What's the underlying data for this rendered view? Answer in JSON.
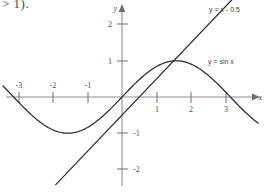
{
  "page": {
    "background_color": "#ffffff",
    "fragment_text": "> 1)."
  },
  "chart_data": {
    "type": "line",
    "title": "",
    "subtitle": "",
    "xlabel": "x",
    "ylabel": "y",
    "xlim": [
      -3.6,
      4.0
    ],
    "ylim": [
      -2.6,
      2.5
    ],
    "grid": false,
    "legend_position": "inline-annotation",
    "x_ticks": [
      -3,
      -2,
      -1,
      1,
      2,
      3
    ],
    "x_tick_labels": [
      "-3",
      "-2",
      "-1",
      "1",
      "2",
      "3"
    ],
    "y_ticks": [
      2,
      1,
      -1,
      -2
    ],
    "y_tick_labels": [
      "2",
      "1",
      "-1",
      "-2"
    ],
    "origin_label": "",
    "series": [
      {
        "name": "y = sin x",
        "label": "y = sin x",
        "expression": "sin(x)",
        "color": "#2b2b2b",
        "x_start": -3.45,
        "x_end": 3.95,
        "key_points": [
          {
            "x": -3.1416,
            "y": 0
          },
          {
            "x": -1.5708,
            "y": -1
          },
          {
            "x": 0,
            "y": 0
          },
          {
            "x": 1.5708,
            "y": 1
          },
          {
            "x": 3.1416,
            "y": 0
          },
          {
            "x": 3.95,
            "y": -0.73
          }
        ]
      },
      {
        "name": "y = x - 0.5",
        "label": "y = x - 0.5",
        "expression": "x - 0.5",
        "color": "#2b2b2b",
        "x_start": -1.92,
        "x_end": 4.02,
        "key_points": [
          {
            "x": -1.92,
            "y": -2.42
          },
          {
            "x": 0,
            "y": -0.5
          },
          {
            "x": 0.5,
            "y": 0
          },
          {
            "x": 1.5,
            "y": 1.0
          },
          {
            "x": 4.02,
            "y": 3.52
          }
        ]
      }
    ],
    "annotations": [
      {
        "name": "line-label",
        "text": "y = x - 0.5",
        "x": 2.6,
        "y": 2.45
      },
      {
        "name": "sine-label",
        "text": "y = sin x",
        "x": 2.55,
        "y": 0.92
      }
    ],
    "intersections": [
      {
        "x": 1.5,
        "y": 1.0,
        "description": "sine curve meets line near its peak"
      }
    ]
  }
}
